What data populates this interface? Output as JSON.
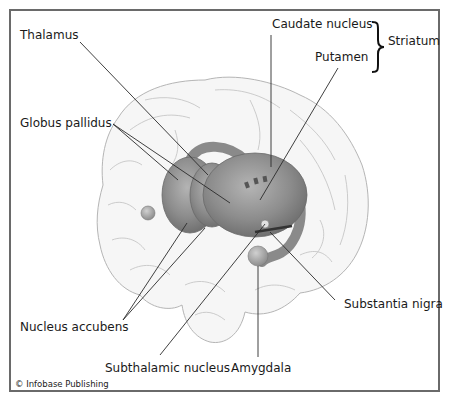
{
  "diagram": {
    "labels": {
      "thalamus": "Thalamus",
      "globus_pallidus": "Globus pallidus",
      "caudate_nucleus": "Caudate nucleus",
      "putamen": "Putamen",
      "striatum": "Striatum",
      "nucleus_accubens": "Nucleus accubens",
      "subthalamic_nucleus": "Subthalamic nucleus",
      "amygdala": "Amygdala",
      "substantia_nigra": "Substantia nigra"
    },
    "credit": "© Infobase Publishing",
    "colors": {
      "frame": "#6a6a6a",
      "brain_outline": "#b8b8b8",
      "brain_fill": "#f4f4f4",
      "structure_fill": "#8e8e8e",
      "structure_dark": "#6e6e6e",
      "leader_line": "#2a2a2a"
    }
  }
}
